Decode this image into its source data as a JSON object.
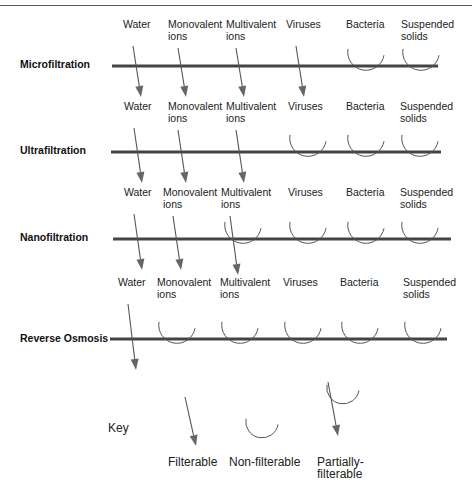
{
  "processes": [
    {
      "name": "Microfiltration",
      "label_y": 68,
      "line_y": 66,
      "line_x1": 112,
      "line_x2": 438,
      "text_y": 28,
      "species": [
        {
          "label": [
            "Water"
          ],
          "x": 123,
          "mode": "filterable"
        },
        {
          "label": [
            "Monovalent",
            "ions"
          ],
          "x": 168,
          "mode": "filterable"
        },
        {
          "label": [
            "Multivalent",
            "ions"
          ],
          "x": 226,
          "mode": "filterable"
        },
        {
          "label": [
            "Viruses"
          ],
          "x": 286,
          "mode": "filterable"
        },
        {
          "label": [
            "Bacteria"
          ],
          "x": 346,
          "mode": "non-filterable"
        },
        {
          "label": [
            "Suspended",
            "solids"
          ],
          "x": 401,
          "mode": "non-filterable"
        }
      ]
    },
    {
      "name": "Ultrafiltration",
      "label_y": 154,
      "line_y": 152,
      "line_x1": 111,
      "line_x2": 441,
      "text_y": 110,
      "species": [
        {
          "label": [
            "Water"
          ],
          "x": 124,
          "mode": "filterable"
        },
        {
          "label": [
            "Monovalent",
            "ions"
          ],
          "x": 168,
          "mode": "filterable"
        },
        {
          "label": [
            "Multivalent",
            "ions"
          ],
          "x": 226,
          "mode": "filterable"
        },
        {
          "label": [
            "Viruses"
          ],
          "x": 288,
          "mode": "non-filterable"
        },
        {
          "label": [
            "Bacteria"
          ],
          "x": 346,
          "mode": "non-filterable"
        },
        {
          "label": [
            "Suspended",
            "solids"
          ],
          "x": 400,
          "mode": "non-filterable"
        }
      ]
    },
    {
      "name": "Nanofiltration",
      "label_y": 241,
      "line_y": 239,
      "line_x1": 113,
      "line_x2": 451,
      "text_y": 196,
      "species": [
        {
          "label": [
            "Water"
          ],
          "x": 124,
          "mode": "filterable"
        },
        {
          "label": [
            "Monovalent",
            "ions"
          ],
          "x": 163,
          "mode": "filterable"
        },
        {
          "label": [
            "Multivalent",
            "ions"
          ],
          "x": 221,
          "mode": "partially-filterable"
        },
        {
          "label": [
            "Viruses"
          ],
          "x": 288,
          "mode": "non-filterable"
        },
        {
          "label": [
            "Bacteria"
          ],
          "x": 346,
          "mode": "non-filterable"
        },
        {
          "label": [
            "Suspended",
            "solids"
          ],
          "x": 400,
          "mode": "non-filterable"
        }
      ]
    },
    {
      "name": "Reverse Osmosis",
      "label_y": 342,
      "line_y": 339,
      "line_x1": 110,
      "line_x2": 447,
      "text_y": 286,
      "species": [
        {
          "label": [
            "Water"
          ],
          "x": 118,
          "mode": "filterable"
        },
        {
          "label": [
            "Monovalent",
            "ions"
          ],
          "x": 157,
          "mode": "non-filterable"
        },
        {
          "label": [
            "Multivalent",
            "ions"
          ],
          "x": 220,
          "mode": "non-filterable"
        },
        {
          "label": [
            "Viruses"
          ],
          "x": 283,
          "mode": "non-filterable"
        },
        {
          "label": [
            "Bacteria"
          ],
          "x": 340,
          "mode": "non-filterable"
        },
        {
          "label": [
            "Suspended",
            "solids"
          ],
          "x": 403,
          "mode": "non-filterable"
        }
      ]
    }
  ],
  "key": {
    "title": "Key",
    "items": [
      {
        "mode": "filterable",
        "label": [
          "Filterable"
        ],
        "x": 199
      },
      {
        "mode": "non-filterable",
        "label": [
          "Non-filterable"
        ],
        "x": 263
      },
      {
        "mode": "partially-filterable",
        "label": [
          "Partially-",
          "filterable"
        ],
        "x": 328
      }
    ]
  },
  "colors": {
    "membrane": "#444444",
    "arrow": "#555555",
    "text": "#222222"
  }
}
